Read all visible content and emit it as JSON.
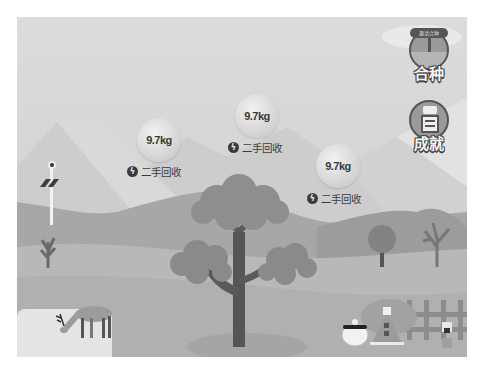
{
  "scene": {
    "name": "forest-landscape",
    "colors": {
      "sky": "#d8d8d8",
      "far_mountain": "#c8c8c8",
      "mid_hill": "#a9a9a9",
      "ground": "#b9b9b9",
      "tree_crown": "#8f8f8f",
      "tree_trunk": "#555555"
    }
  },
  "energy_bubbles": [
    {
      "value": "9.7kg",
      "source_label": "二手回收",
      "icon": "lightning-icon"
    },
    {
      "value": "9.7kg",
      "source_label": "二手回收",
      "icon": "lightning-icon"
    },
    {
      "value": "9.7kg",
      "source_label": "二手回收",
      "icon": "lightning-icon"
    }
  ],
  "side_buttons": [
    {
      "label": "合种",
      "badge": "邀请合种",
      "icon": "signpost-icon"
    },
    {
      "label": "成就",
      "icon": "certificate-icon"
    }
  ],
  "decorations": {
    "lamp": "solar-lamp",
    "animal": "deer",
    "house": "small-hut",
    "pet": "white-bird",
    "fence": "wooden-fence"
  }
}
